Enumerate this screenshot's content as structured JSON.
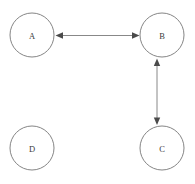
{
  "diagram": {
    "type": "directed-graph",
    "title": "",
    "background_color": "#ffffff",
    "node_stroke_color": "#777777",
    "node_fill_color": "#ffffff",
    "edge_color": "#7a7a7a",
    "arrow_color": "#4a4a4a",
    "label_color": "#3a3a3a",
    "nodes": [
      {
        "id": "A",
        "label": "A",
        "cx": 32,
        "cy": 35,
        "r": 22
      },
      {
        "id": "B",
        "label": "B",
        "cx": 162,
        "cy": 35,
        "r": 22
      },
      {
        "id": "C",
        "label": "C",
        "cx": 162,
        "cy": 148,
        "r": 22
      },
      {
        "id": "D",
        "label": "D",
        "cx": 32,
        "cy": 148,
        "r": 22
      }
    ],
    "edges": [
      {
        "id": "edge-a-b",
        "source": "A",
        "target": "B",
        "directed": "both",
        "label": "",
        "x1": 55,
        "y1": 35,
        "x2": 139,
        "y2": 35
      },
      {
        "id": "edge-b-c",
        "source": "B",
        "target": "C",
        "directed": "both",
        "label": "",
        "x1": 157,
        "y1": 58,
        "x2": 157,
        "y2": 125
      }
    ],
    "isolated_nodes": [
      "D"
    ]
  }
}
